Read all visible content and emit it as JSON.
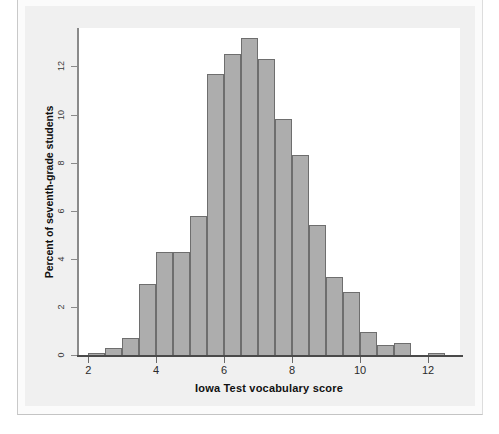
{
  "figure": {
    "colors": {
      "bar_fill": "#adadad",
      "bar_edge": "#6e6e6e",
      "axis": "#4a4a4a",
      "panel_bg": "#ffffff",
      "figure_bg": "#f0f0f0"
    }
  },
  "chart_data": {
    "type": "bar",
    "title": "",
    "subtitle": "",
    "xlabel": "Iowa Test vocabulary score",
    "ylabel": "Percent of seventh-grade students",
    "xlim": [
      1.7,
      13.0
    ],
    "ylim": [
      0,
      13.6
    ],
    "xticks": [
      2,
      4,
      6,
      8,
      10,
      12
    ],
    "xtick_labels": [
      "2",
      "4",
      "6",
      "8",
      "10",
      "12"
    ],
    "yticks": [
      0,
      2,
      4,
      6,
      8,
      10,
      12
    ],
    "ytick_labels": [
      "0",
      "2",
      "4",
      "6",
      "8",
      "10",
      "12"
    ],
    "grid": false,
    "legend": "none",
    "bin_width": 0.5,
    "bin_edges": [
      2.0,
      2.5,
      3.0,
      3.5,
      4.0,
      4.5,
      5.0,
      5.5,
      6.0,
      6.5,
      7.0,
      7.5,
      8.0,
      8.5,
      9.0,
      9.5,
      10.0,
      10.5,
      11.0,
      11.5,
      12.0,
      12.5
    ],
    "bin_centers": [
      2.25,
      2.75,
      3.25,
      3.75,
      4.25,
      4.75,
      5.25,
      5.75,
      6.25,
      6.75,
      7.25,
      7.75,
      8.25,
      8.75,
      9.25,
      9.75,
      10.25,
      10.75,
      11.25,
      11.75,
      12.25
    ],
    "categories": [
      "2.0-2.5",
      "2.5-3.0",
      "3.0-3.5",
      "3.5-4.0",
      "4.0-4.5",
      "4.5-5.0",
      "5.0-5.5",
      "5.5-6.0",
      "6.0-6.5",
      "6.5-7.0",
      "7.0-7.5",
      "7.5-8.0",
      "8.0-8.5",
      "8.5-9.0",
      "9.0-9.5",
      "9.5-10.0",
      "10.0-10.5",
      "10.5-11.0",
      "11.0-11.5",
      "11.5-12.0",
      "12.0-12.5"
    ],
    "values": [
      0.1,
      0.3,
      0.7,
      2.95,
      4.3,
      4.3,
      5.8,
      11.7,
      12.5,
      13.2,
      12.3,
      9.8,
      8.3,
      5.4,
      3.25,
      2.6,
      0.95,
      0.4,
      0.5,
      0.0,
      0.1
    ]
  }
}
